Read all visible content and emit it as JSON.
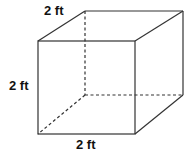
{
  "diagram": {
    "shape": "cube",
    "labels": {
      "depth": "2 ft",
      "height": "2 ft",
      "width": "2 ft"
    },
    "colors": {
      "stroke": "#333333",
      "text": "#111111",
      "background": "#ffffff"
    }
  }
}
